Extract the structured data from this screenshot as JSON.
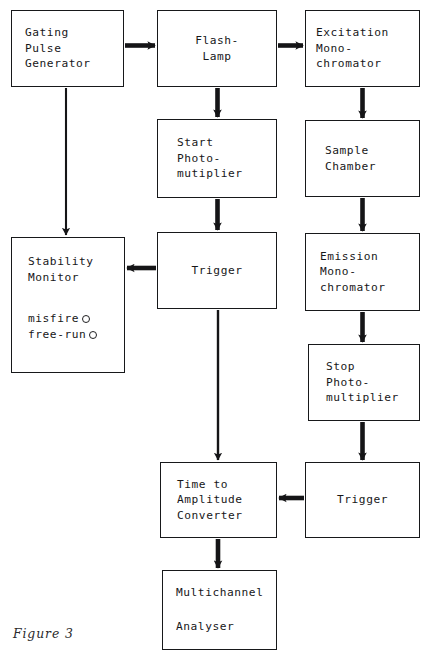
{
  "figure": {
    "caption": "Figure 3",
    "background_color": "#ffffff",
    "ink_color": "#171719"
  },
  "nodes": {
    "gating_pulse_generator": {
      "lines": [
        "Gating",
        "Pulse",
        "Generator"
      ],
      "x": 11,
      "y": 10,
      "w": 113,
      "h": 77
    },
    "flash_lamp": {
      "lines": [
        "Flash-",
        "Lamp"
      ],
      "x": 157,
      "y": 10,
      "w": 120,
      "h": 77
    },
    "excitation_monochromator": {
      "lines": [
        "Excitation",
        "Mono-",
        "chromator"
      ],
      "x": 305,
      "y": 10,
      "w": 115,
      "h": 77
    },
    "start_photomultiplier": {
      "lines": [
        "Start",
        "Photo-",
        "mutiplier"
      ],
      "x": 157,
      "y": 119,
      "w": 120,
      "h": 79
    },
    "sample_chamber": {
      "lines": [
        "Sample",
        "Chamber"
      ],
      "x": 305,
      "y": 120,
      "w": 115,
      "h": 77
    },
    "stability_monitor": {
      "title_lines": [
        "Stability",
        "Monitor"
      ],
      "indicators": [
        {
          "label": "misfire",
          "lamp": "o"
        },
        {
          "label": "free-run",
          "lamp": "o"
        }
      ],
      "x": 11,
      "y": 237,
      "w": 114,
      "h": 136
    },
    "trigger_upper": {
      "lines": [
        "Trigger"
      ],
      "x": 157,
      "y": 232,
      "w": 120,
      "h": 77
    },
    "emission_monochromator": {
      "lines": [
        "Emission",
        "Mono-",
        "chromator"
      ],
      "x": 305,
      "y": 233,
      "w": 115,
      "h": 78
    },
    "stop_photomultiplier": {
      "lines": [
        "Stop",
        "Photo-",
        "multiplier"
      ],
      "x": 308,
      "y": 344,
      "w": 112,
      "h": 77
    },
    "time_to_amplitude_converter": {
      "lines": [
        "Time to",
        "Amplitude",
        "Converter"
      ],
      "x": 160,
      "y": 462,
      "w": 117,
      "h": 76
    },
    "trigger_lower": {
      "lines": [
        "Trigger"
      ],
      "x": 305,
      "y": 462,
      "w": 115,
      "h": 76
    },
    "multichannel_analyser": {
      "lines": [
        "Multichannel",
        "Analyser"
      ],
      "x": 162,
      "y": 570,
      "w": 115,
      "h": 80
    }
  },
  "connections": [
    {
      "name": "gating-to-flashlamp",
      "from": "gating_pulse_generator",
      "to": "flash_lamp",
      "direction": "right",
      "weight": "thick"
    },
    {
      "name": "flashlamp-to-excitation",
      "from": "flash_lamp",
      "to": "excitation_monochromator",
      "direction": "right",
      "weight": "thick"
    },
    {
      "name": "flashlamp-to-start-pmt",
      "from": "flash_lamp",
      "to": "start_photomultiplier",
      "direction": "down",
      "weight": "thick"
    },
    {
      "name": "excitation-to-sample",
      "from": "excitation_monochromator",
      "to": "sample_chamber",
      "direction": "down",
      "weight": "thick"
    },
    {
      "name": "gating-to-stability",
      "from": "gating_pulse_generator",
      "to": "stability_monitor",
      "direction": "down",
      "weight": "thin"
    },
    {
      "name": "start-pmt-to-trigger",
      "from": "start_photomultiplier",
      "to": "trigger_upper",
      "direction": "down",
      "weight": "thick"
    },
    {
      "name": "sample-to-emission",
      "from": "sample_chamber",
      "to": "emission_monochromator",
      "direction": "down",
      "weight": "thick"
    },
    {
      "name": "trigger-to-stability",
      "from": "trigger_upper",
      "to": "stability_monitor",
      "direction": "left",
      "weight": "thick"
    },
    {
      "name": "emission-to-stop-pmt",
      "from": "emission_monochromator",
      "to": "stop_photomultiplier",
      "direction": "down",
      "weight": "thick"
    },
    {
      "name": "trigger-to-tac",
      "from": "trigger_upper",
      "to": "time_to_amplitude_converter",
      "direction": "down",
      "weight": "thin"
    },
    {
      "name": "stop-pmt-to-trigger-lower",
      "from": "stop_photomultiplier",
      "to": "trigger_lower",
      "direction": "down",
      "weight": "thick"
    },
    {
      "name": "trigger-lower-to-tac",
      "from": "trigger_lower",
      "to": "time_to_amplitude_converter",
      "direction": "left",
      "weight": "thick"
    },
    {
      "name": "tac-to-mca",
      "from": "time_to_amplitude_converter",
      "to": "multichannel_analyser",
      "direction": "down",
      "weight": "thick"
    }
  ]
}
